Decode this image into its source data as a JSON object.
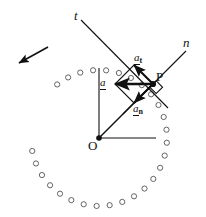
{
  "figure": {
    "background_color": "#ffffff",
    "stroke_color": "#111111",
    "width": 206,
    "height": 217
  },
  "labels": {
    "tangent_axis": "t",
    "normal_axis": "n",
    "point_p": "P",
    "origin_o": "O",
    "accel_total_base": "a",
    "accel_total_sub": "",
    "accel_tangential_base": "a",
    "accel_tangential_sub": "t",
    "accel_normal_base": "a",
    "accel_normal_sub": "n"
  },
  "geometry": {
    "origin": {
      "x": 99,
      "y": 138
    },
    "point_p": {
      "x": 153,
      "y": 84
    },
    "tangent_line": {
      "x1": 81,
      "y1": 20,
      "x2": 168,
      "y2": 108
    },
    "normal_line": {
      "x1": 123,
      "y1": 114,
      "x2": 186,
      "y2": 51
    },
    "radius_line": {
      "x1": 99,
      "y1": 138,
      "x2": 153,
      "y2": 84
    },
    "vertical_ref_line": {
      "x1": 99,
      "y1": 68,
      "x2": 99,
      "y2": 138
    },
    "horizontal_ref_line": {
      "x1": 99,
      "y1": 138,
      "x2": 156,
      "y2": 138
    },
    "right_angle_marker_size": 9,
    "motion_arrow": {
      "x1": 48,
      "y1": 47,
      "x2": 19,
      "y2": 63
    }
  },
  "vectors": {
    "a_total": {
      "from_x": 153,
      "from_y": 84,
      "to_x": 115,
      "to_y": 84
    },
    "a_tangential": {
      "from_x": 153,
      "from_y": 84,
      "to_x": 134,
      "to_y": 65
    },
    "a_normal": {
      "from_x": 153,
      "from_y": 84,
      "to_x": 134,
      "to_y": 103
    },
    "parallelogram": [
      {
        "x": 153,
        "y": 84
      },
      {
        "x": 134,
        "y": 65
      },
      {
        "x": 115,
        "y": 84
      },
      {
        "x": 134,
        "y": 103
      }
    ]
  },
  "label_positions": {
    "tangent_axis": {
      "left": 74,
      "top": 9
    },
    "normal_axis": {
      "left": 183,
      "top": 36
    },
    "point_p": {
      "left": 156,
      "top": 70
    },
    "origin_o": {
      "left": 88,
      "top": 139
    },
    "accel_total": {
      "left": 100,
      "top": 77
    },
    "accel_tangential": {
      "left": 134,
      "top": 52
    },
    "accel_normal": {
      "left": 133,
      "top": 103
    }
  },
  "particle_ring": {
    "center": {
      "x": 99,
      "y": 138
    },
    "radius": 68,
    "marker_radius": 2.6,
    "marker_fill": "#ffffff",
    "marker_stroke": "#555555",
    "count": 28,
    "start_angle_deg": -128,
    "sweep_deg": 310,
    "angles_deg": [
      -128,
      -117,
      -106,
      -95,
      -84,
      -73,
      -62,
      -51,
      -40,
      -29,
      -18,
      -7,
      4,
      15,
      26,
      37,
      48,
      59,
      70,
      81,
      92,
      103,
      114,
      125,
      136,
      147,
      158,
      169
    ]
  }
}
